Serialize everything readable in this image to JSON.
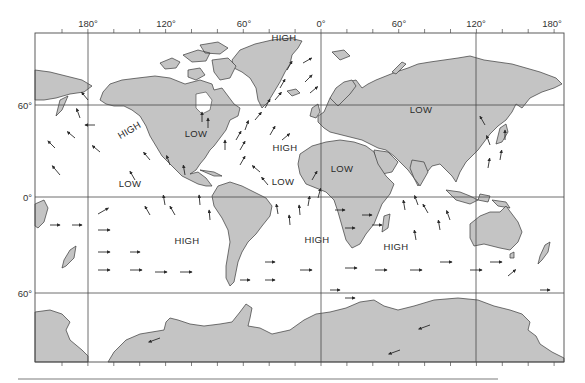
{
  "map": {
    "title": "Global surface wind and pressure pattern",
    "frame": {
      "left": 35,
      "top": 33,
      "right": 564,
      "bottom": 362
    },
    "colors": {
      "land": "#c4c4c4",
      "ocean": "#ffffff",
      "grid": "#4a4a4a",
      "text": "#2a2a2a"
    },
    "longitude_labels": [
      {
        "text": "180°",
        "x": 88
      },
      {
        "text": "120°",
        "x": 166
      },
      {
        "text": "60°",
        "x": 244
      },
      {
        "text": "0°",
        "x": 321
      },
      {
        "text": "60°",
        "x": 399
      },
      {
        "text": "120°",
        "x": 476
      },
      {
        "text": "180°",
        "x": 552
      }
    ],
    "latitude_labels": [
      {
        "text": "60°",
        "y": 105
      },
      {
        "text": "0°",
        "y": 197
      },
      {
        "text": "60°",
        "y": 293
      }
    ],
    "pressure_labels": [
      {
        "text": "HIGH",
        "x": 284,
        "y": 13,
        "rotate": 0,
        "region": "greenland"
      },
      {
        "text": "HIGH",
        "x": 131,
        "y": 133,
        "rotate": -30,
        "region": "north-pacific"
      },
      {
        "text": "LOW",
        "x": 196,
        "y": 137,
        "rotate": 0,
        "region": "north-america"
      },
      {
        "text": "HIGH",
        "x": 285,
        "y": 151,
        "rotate": 0,
        "region": "north-atlantic"
      },
      {
        "text": "LOW",
        "x": 421,
        "y": 113,
        "rotate": 0,
        "region": "asia"
      },
      {
        "text": "LOW",
        "x": 342,
        "y": 172,
        "rotate": 0,
        "region": "north-africa"
      },
      {
        "text": "LOW",
        "x": 283,
        "y": 185,
        "rotate": 0,
        "region": "equatorial-atlantic"
      },
      {
        "text": "LOW",
        "x": 130,
        "y": 187,
        "rotate": 0,
        "region": "equatorial-pacific"
      },
      {
        "text": "HIGH",
        "x": 187,
        "y": 244,
        "rotate": 0,
        "region": "south-pacific"
      },
      {
        "text": "HIGH",
        "x": 317,
        "y": 243,
        "rotate": 0,
        "region": "south-atlantic"
      },
      {
        "text": "HIGH",
        "x": 396,
        "y": 250,
        "rotate": 0,
        "region": "indian-ocean"
      }
    ]
  }
}
